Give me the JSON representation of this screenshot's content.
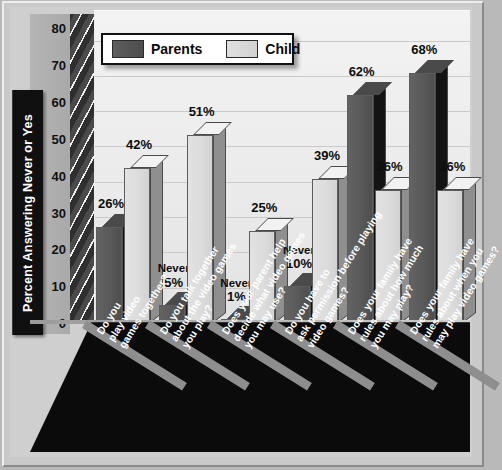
{
  "chart_data": {
    "type": "bar",
    "title": "",
    "xlabel": "",
    "ylabel": "Percent Answering Never or Yes",
    "ylim": [
      0,
      85
    ],
    "yticks": [
      0,
      10,
      20,
      30,
      40,
      50,
      60,
      70,
      80
    ],
    "grid": true,
    "legend_position": "top-left",
    "categories": [
      "Do you play video games together?",
      "Do you talk together about the video games you play?",
      "Does your parent help decide what video games you may use?",
      "Do you have to ask permission before playing video games?",
      "Does your family have rules about how much you may play?",
      "Does your family have rules about when you may play video games?"
    ],
    "series": [
      {
        "name": "Parents",
        "color": "#4e4e4e",
        "values": [
          26,
          5,
          1,
          10,
          62,
          68
        ]
      },
      {
        "name": "Child",
        "color": "#d8d8d8",
        "values": [
          42,
          51,
          25,
          39,
          36,
          36
        ]
      }
    ],
    "answer_labels": {
      "Parents": [
        "Never",
        "Never",
        "Never",
        "Never",
        "Yes",
        "Yes"
      ],
      "Child": [
        "Never",
        "Never",
        "Never",
        "Never",
        "Yes",
        "Yes"
      ]
    },
    "value_labels": {
      "Parents": [
        "26%",
        "5%",
        "1%",
        "10%",
        "62%",
        "68%"
      ],
      "Child": [
        "42%",
        "51%",
        "25%",
        "39%",
        "36%",
        "36%"
      ]
    }
  },
  "legend": {
    "parents_label": "Parents",
    "child_label": "Child"
  },
  "axis": {
    "y_title": "Percent Answering Never or Yes",
    "ticks": [
      "80",
      "70",
      "60",
      "50",
      "40",
      "30",
      "20",
      "10",
      "0"
    ]
  }
}
